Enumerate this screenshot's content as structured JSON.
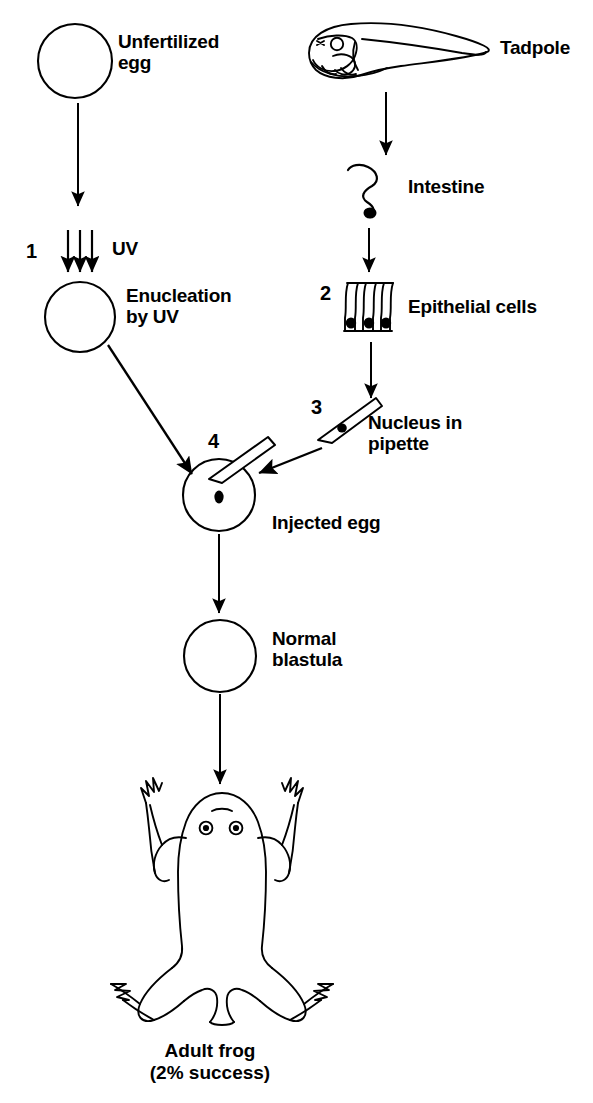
{
  "figure": {
    "stroke_color": "#000000",
    "background_color": "#ffffff"
  },
  "labels": {
    "unfertilized_egg": "Unfertilized\negg",
    "tadpole": "Tadpole",
    "uv": "UV",
    "enucleation_by_uv": "Enucleation\nby UV",
    "intestine": "Intestine",
    "epithelial_cells": "Epithelial cells",
    "nucleus_in_pipette": "Nucleus in\npipette",
    "injected_egg": "Injected egg",
    "normal_blastula": "Normal\nblastula",
    "adult_frog_caption": "Adult frog\n(2% success)"
  },
  "step_numbers": {
    "step1": "1",
    "step2": "2",
    "step3": "3",
    "step4": "4"
  },
  "shapes": {
    "unfertilized_egg_circle": "circle",
    "enucleated_egg_circle": "circle",
    "injected_egg_circle": "circle",
    "blastula_circle": "circle",
    "tadpole_drawing": "tadpole-icon",
    "intestine_drawing": "intestine-icon",
    "epithelial_cells_drawing": "epithelial-cells-icon",
    "pipette_drawing": "pipette-icon",
    "frog_drawing": "frog-icon"
  }
}
